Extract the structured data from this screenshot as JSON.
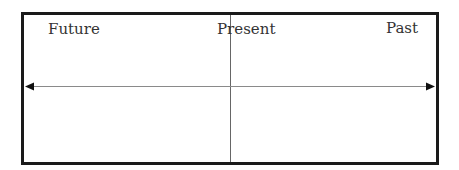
{
  "diagram": {
    "type": "timeline-axis",
    "labels": {
      "left": "Future",
      "center": "Present",
      "right": "Past"
    },
    "colors": {
      "border": "#1a1a1a",
      "axis": "#888888",
      "divider": "#666666",
      "text": "#333333",
      "background": "#ffffff"
    }
  }
}
